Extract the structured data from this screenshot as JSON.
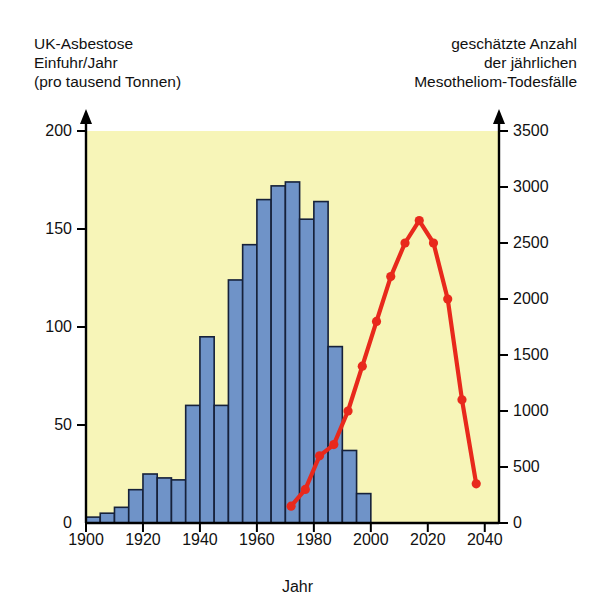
{
  "titles": {
    "left": "UK-Asbestose\nEinfuhr/Jahr\n(pro tausend Tonnen)",
    "right": "geschätzte Anzahl\nder jährlichen\nMesotheliom-Todesfälle"
  },
  "colors": {
    "plot_background": "#f7f5b8",
    "bar_fill": "#6f93c8",
    "bar_edge": "#16213a",
    "line": "#e8291c",
    "axis": "#000000",
    "text": "#111111"
  },
  "chart_data": {
    "type": "bar",
    "xlabel": "Jahr",
    "ylabel": "UK-Asbestose Einfuhr/Jahr (pro tausend Tonnen)",
    "y2label": "geschätzte Anzahl der jährlichen Mesotheliom-Todesfälle",
    "xlim": [
      1900,
      2045
    ],
    "ylim": [
      0,
      200
    ],
    "y2lim": [
      0,
      3500
    ],
    "grid": false,
    "legend": "none",
    "xticks": [
      1900,
      1920,
      1940,
      1960,
      1980,
      2000,
      2020,
      2040
    ],
    "xticklabels": [
      "1900",
      "1920",
      "1940",
      "1960",
      "1980",
      "2000",
      "2020",
      "2040"
    ],
    "yticks": [
      0,
      50,
      100,
      150,
      200
    ],
    "yticklabels": [
      "0",
      "50",
      "100",
      "150",
      "200"
    ],
    "y2ticks": [
      0,
      500,
      1000,
      1500,
      2000,
      2500,
      3000,
      3500
    ],
    "y2ticklabels": [
      "0",
      "500",
      "1000",
      "1500",
      "2000",
      "2500",
      "3000",
      "3500"
    ],
    "series": [
      {
        "name": "UK-Asbest-Einfuhr",
        "type": "bar",
        "axis": "left",
        "bin_width_years": 5,
        "x": [
          1900,
          1905,
          1910,
          1915,
          1920,
          1925,
          1930,
          1935,
          1940,
          1945,
          1950,
          1955,
          1960,
          1965,
          1970,
          1975,
          1980,
          1985,
          1990,
          1995
        ],
        "values": [
          3,
          5,
          8,
          17,
          25,
          23,
          22,
          60,
          95,
          60,
          124,
          142,
          165,
          172,
          174,
          155,
          164,
          90,
          37,
          15
        ]
      },
      {
        "name": "Mesotheliom-Todesfälle",
        "type": "line",
        "axis": "right",
        "x": [
          1972,
          1977,
          1982,
          1987,
          1992,
          1997,
          2002,
          2007,
          2012,
          2017,
          2022,
          2027,
          2032,
          2037
        ],
        "values": [
          150,
          300,
          600,
          700,
          1000,
          1400,
          1800,
          2200,
          2500,
          2700,
          2500,
          2000,
          1100,
          350
        ]
      }
    ]
  }
}
